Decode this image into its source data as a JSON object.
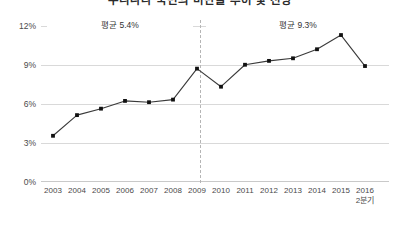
{
  "chart_data": {
    "type": "line",
    "title": "우리나라 국민의 비만율 추이 및 전망",
    "xlabel": "",
    "ylabel": "",
    "categories": [
      "2003",
      "2004",
      "2005",
      "2006",
      "2007",
      "2008",
      "2009",
      "2010",
      "2011",
      "2012",
      "2013",
      "2014",
      "2015",
      "2016\n2분기"
    ],
    "x_tick_labels": [
      "2003",
      "2004",
      "2005",
      "2006",
      "2007",
      "2008",
      "2009",
      "2010",
      "2011",
      "2012",
      "2013",
      "2014",
      "2015",
      "2016\n2분기"
    ],
    "values": [
      3.5,
      5.1,
      5.6,
      6.2,
      6.1,
      6.3,
      8.7,
      7.3,
      9.0,
      9.3,
      9.5,
      10.2,
      11.3,
      8.9
    ],
    "series": [
      {
        "name": "",
        "values": [
          3.5,
          5.1,
          5.6,
          6.2,
          6.1,
          6.3,
          8.7,
          7.3,
          9.0,
          9.3,
          9.5,
          10.2,
          11.3,
          8.9
        ]
      }
    ],
    "ylim": [
      0,
      12
    ],
    "y_ticks": [
      0,
      3,
      6,
      9,
      12
    ],
    "y_tick_labels": [
      "0%",
      "3%",
      "6%",
      "9%",
      "12%"
    ],
    "grid": true,
    "legend": "none",
    "marker": "square",
    "line_color": "#3a3a3a",
    "marker_color": "#111111",
    "grid_color": "#d9d9d9",
    "annotations": [
      {
        "name": "left-average",
        "label": "평균 5.4%",
        "value": 5.4,
        "from_category": "2003",
        "to_category": "2009",
        "style": "double-arrow"
      },
      {
        "name": "right-average",
        "label": "평균 9.3%",
        "value": 9.3,
        "from_category": "2009",
        "to_category": "2016\n2분기",
        "style": "double-arrow"
      }
    ],
    "divider": {
      "at_category": "2009",
      "style": "dashed",
      "color": "#b5b5b5"
    }
  }
}
